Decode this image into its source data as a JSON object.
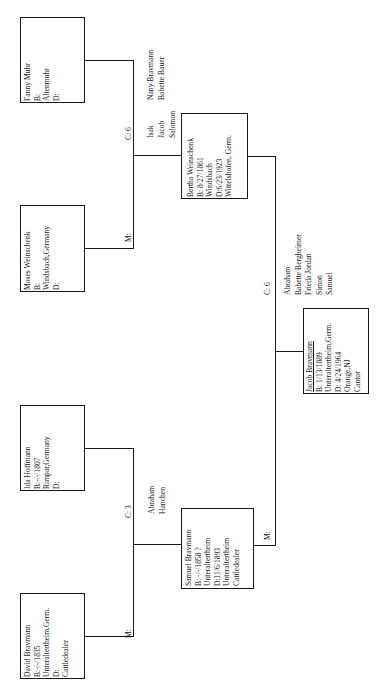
{
  "chart": {
    "orientation": "rotated-90-ccw",
    "people": {
      "fanny": {
        "name": "Fanny Muhr",
        "birth": "B:",
        "place": "Altenmuhr",
        "death": "D:"
      },
      "moses": {
        "name": "Moses Weinschenk",
        "birth": "B:",
        "place": "Windsbach,Germany",
        "death": "D:"
      },
      "bertha": {
        "name": "Bertha Weinschenk",
        "birth": "B: 8/27/1861",
        "birth_place": "Windsbach",
        "death": "D:6/23/1923",
        "death_place": "Wittelshofen, Germ."
      },
      "ida": {
        "name": "Ida Hoffmann",
        "birth": "B:-/-/1807",
        "place": "Rimpar,Germany",
        "death": "D:"
      },
      "david": {
        "name": "David Bravmann",
        "birth": "B:-/-/1835",
        "place": "Unteraltertheim,Germ.",
        "death": "D:",
        "occupation": "Cattledealer"
      },
      "samuel": {
        "name": "Samuel Bravmann",
        "birth": "B: -/-/1858 ?",
        "birth_place": "Unteraltertheim",
        "death": "D:11/6/1893",
        "death_place": "Unteraltertheim",
        "occupation": "Cattledealer"
      },
      "jacob": {
        "name": "Jacob Bravmann",
        "birth": "B: 1/13/1889",
        "birth_place": "Unteraltertheim,Germ.",
        "death": "D: 4/24/1964",
        "death_place": "Orange,NJ",
        "occupation": "Cantor"
      }
    },
    "marriage_labels": {
      "fanny_moses": "M:",
      "ida_david": "M:",
      "bertha_samuel": "M:"
    },
    "children_counts": {
      "fanny_moses": "C: 6",
      "ida_david": "C: 3",
      "bertha_samuel": "C: 6"
    },
    "siblings": {
      "bertha": [
        "Isak",
        "Jacob",
        "Salomon",
        "Nany Bravmann",
        "Babette Bauer"
      ],
      "bertha_col1": [
        "Isak",
        "Jacob",
        "Salomon"
      ],
      "bertha_col2": [
        "Nany Bravmann",
        "Babette Bauer"
      ],
      "samuel": [
        "Abraham",
        "Hanchen"
      ],
      "jacob": [
        "Abraham",
        "Babette Bergheimer",
        "Frieda Jordan",
        "Simon",
        "Samuel"
      ]
    }
  }
}
